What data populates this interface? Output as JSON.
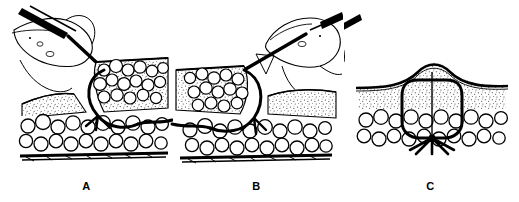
{
  "figure": {
    "background_color": "#ffffff",
    "ink_color": "#000000",
    "panel_count": 3
  },
  "panels": [
    {
      "id": "a",
      "label": "A",
      "caption": "Needle driver passes curved needle from deep dermis upward through the retracted wound edge; suture tail exits to the right.",
      "hand_present": true,
      "instrument": "needle-holder",
      "instrument_angle_deg": -28,
      "thread_exit_side": "right",
      "needle_entry": "deep-to-superficial"
    },
    {
      "id": "b",
      "label": "B",
      "caption": "Mirror-image pass on the opposite wound edge; needle enters superficially and exits deep, suture tail trails to the left.",
      "hand_present": true,
      "instrument": "needle-holder",
      "instrument_angle_deg": 28,
      "thread_exit_side": "left",
      "needle_entry": "superficial-to-deep"
    },
    {
      "id": "c",
      "label": "C",
      "caption": "Completed buried suture: knot lies deep, loop approximates dermis, and the skin edges are everted into a slight ridge.",
      "hand_present": false,
      "instrument": "none",
      "thread_exit_side": "none",
      "knot_position": "buried-deep",
      "skin_eversion": true
    }
  ],
  "anatomy": {
    "layers": [
      {
        "name": "epidermis",
        "rendering": "solid-dark-line"
      },
      {
        "name": "dermis",
        "rendering": "fine-stipple"
      },
      {
        "name": "subcutaneous-fat",
        "rendering": "cobblestone-lobules"
      },
      {
        "name": "deep-fascia",
        "rendering": "dark-hatched-band"
      }
    ]
  },
  "suture": {
    "material_rendering": "heavy-black-line",
    "loop_shape": "rounded-rectangle",
    "knot_tails": 2
  }
}
